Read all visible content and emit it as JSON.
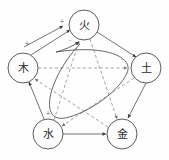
{
  "diagram": {
    "nodes": [
      {
        "id": "fire",
        "label": "火",
        "name": "fire",
        "cx": 84,
        "cy": 25,
        "r": 15
      },
      {
        "id": "wood",
        "label": "木",
        "name": "wood",
        "cx": 23,
        "cy": 68,
        "r": 15
      },
      {
        "id": "earth",
        "label": "土",
        "name": "earth",
        "cx": 146,
        "cy": 68,
        "r": 15
      },
      {
        "id": "water",
        "label": "水",
        "name": "water",
        "cx": 48,
        "cy": 134,
        "r": 15
      },
      {
        "id": "metal",
        "label": "金",
        "name": "metal",
        "cx": 122,
        "cy": 134,
        "r": 15
      }
    ],
    "edges_solid": [
      {
        "from": "wood",
        "to": "fire",
        "style": "solid"
      },
      {
        "from": "fire",
        "to": "earth",
        "style": "solid"
      },
      {
        "from": "earth",
        "to": "metal",
        "style": "solid"
      },
      {
        "from": "water",
        "to": "wood",
        "style": "solid"
      },
      {
        "from": "water",
        "to": "metal",
        "style": "solid"
      },
      {
        "from": "wood",
        "to": "fire",
        "style": "solid"
      }
    ],
    "edges_dashed": [
      {
        "from": "wood",
        "to": "earth",
        "style": "dashed"
      },
      {
        "from": "earth",
        "to": "water",
        "style": "dashed"
      },
      {
        "from": "water",
        "to": "fire",
        "style": "dashed"
      },
      {
        "from": "fire",
        "to": "metal",
        "style": "dashed"
      },
      {
        "from": "metal",
        "to": "wood",
        "style": "dashed"
      }
    ],
    "signs": [
      {
        "text": "+",
        "x": 62,
        "y": 20
      },
      {
        "text": "+",
        "x": 27,
        "y": 42
      },
      {
        "text": "-",
        "x": 70,
        "y": 39
      },
      {
        "text": "-",
        "x": 122,
        "y": 58
      },
      {
        "text": "+",
        "x": 48,
        "y": 112
      }
    ],
    "colors": {
      "node_stroke": "#4a4a4a",
      "solid_edge": "#5a5a5a",
      "dashed_edge": "#8e8e8e",
      "label_text": "#2b2b2b",
      "background": "#fefefe"
    }
  }
}
